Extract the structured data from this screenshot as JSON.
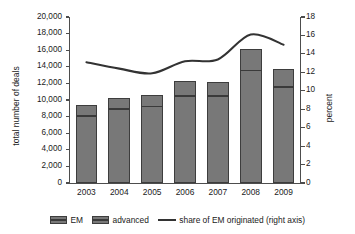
{
  "chart_data": {
    "type": "bar",
    "title": "",
    "subtitle": "",
    "xlabel": "",
    "ylabel": "total number of deals",
    "y2label": "percent",
    "categories": [
      "2003",
      "2004",
      "2005",
      "2006",
      "2007",
      "2008",
      "2009"
    ],
    "series": [
      {
        "name": "EM",
        "axis": "left",
        "stack": "deals",
        "values": [
          8100,
          8950,
          9200,
          10500,
          10500,
          13550,
          11600
        ]
      },
      {
        "name": "advanced",
        "axis": "left",
        "stack": "deals",
        "values": [
          1300,
          1250,
          1350,
          1750,
          1650,
          2550,
          2100
        ]
      },
      {
        "name": "share of EM originated (right axis)",
        "type": "line",
        "axis": "right",
        "values": [
          13.1,
          12.4,
          11.9,
          13.2,
          13.4,
          16.1,
          15.0
        ]
      }
    ],
    "totals": [
      9400,
      10200,
      10550,
      12250,
      12150,
      16100,
      13700
    ],
    "ylim": [
      0,
      20000
    ],
    "y2lim": [
      0,
      18
    ],
    "yticks": [
      "0",
      "2,000",
      "4,000",
      "6,000",
      "8,000",
      "10,000",
      "12,000",
      "14,000",
      "16,000",
      "18,000",
      "20,000"
    ],
    "ytick_values": [
      0,
      2000,
      4000,
      6000,
      8000,
      10000,
      12000,
      14000,
      16000,
      18000,
      20000
    ],
    "y2ticks": [
      "0",
      "2",
      "4",
      "6",
      "8",
      "10",
      "12",
      "14",
      "16",
      "18"
    ],
    "y2tick_values": [
      0,
      2,
      4,
      6,
      8,
      10,
      12,
      14,
      16,
      18
    ],
    "grid": false,
    "legend_position": "bottom",
    "colors": {
      "bar_fill": "#787878",
      "bar_border": "#3d3d3d",
      "divider": "#3a3a3a",
      "line": "#333333",
      "axis": "#4d4d4d",
      "text": "#1a1a1a",
      "background": "#ffffff"
    }
  },
  "legend": {
    "items": [
      {
        "label": "EM",
        "marker": "swatch"
      },
      {
        "label": "advanced",
        "marker": "swatch"
      },
      {
        "label": "share of EM originated (right axis)",
        "marker": "line"
      }
    ]
  }
}
